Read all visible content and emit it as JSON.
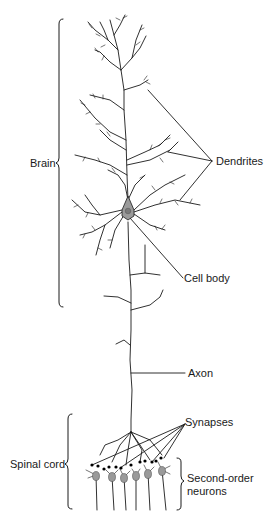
{
  "figure": {
    "labels": {
      "brain": "Brain",
      "dendrites": "Dendrites",
      "cell_body": "Cell body",
      "axon": "Axon",
      "synapses": "Synapses",
      "spinal_cord": "Spinal cord",
      "second_order_line1": "Second-order",
      "second_order_line2": "neurons"
    },
    "colors": {
      "line": "#1a1a1a",
      "soma_fill": "#9a9a9a",
      "nucleus_fill": "#7a7a7a",
      "synapse": "#000000"
    }
  }
}
